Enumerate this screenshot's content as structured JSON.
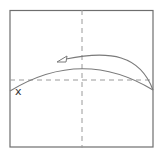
{
  "diagram": {
    "type": "origami-fold-step",
    "paper_square": {
      "left": 10,
      "top": 10,
      "right": 153,
      "bottom": 147
    },
    "creases": {
      "vertical_dashed_x": 82,
      "horizontal_dashed_y": 80
    },
    "fold_line": {
      "description": "curved fold line",
      "left_y": 91,
      "peak_y": 69,
      "right_y": 90
    },
    "arrow": {
      "description": "fold direction arrow pointing left",
      "start": [
        153,
        90
      ],
      "peak_y": 55,
      "tip": [
        57,
        61
      ]
    },
    "label": "x",
    "colors": {
      "stroke": "#7a7a7a",
      "dashed": "#9a9a9a",
      "border": "#6e6e6e",
      "text": "#333333"
    }
  }
}
